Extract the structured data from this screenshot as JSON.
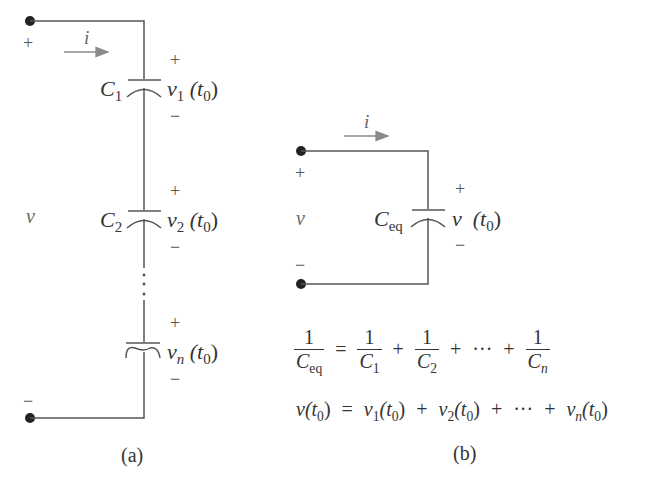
{
  "figure": {
    "series_circuit": {
      "caption": "(a)",
      "source_voltage": "v",
      "current": "i",
      "plus": "+",
      "minus": "−",
      "ellipsis": "⋮",
      "capacitors": [
        {
          "name": "C",
          "sub": "1",
          "voltage": "v",
          "vsub": "1",
          "time": "(t",
          "tsub": "0",
          "close": ")"
        },
        {
          "name": "C",
          "sub": "2",
          "voltage": "v",
          "vsub": "2",
          "time": "(t",
          "tsub": "0",
          "close": ")"
        },
        {
          "name": "C",
          "sub": "n",
          "voltage": "v",
          "vsub": "n",
          "time": "(t",
          "tsub": "0",
          "close": ")"
        }
      ]
    },
    "equivalent_circuit": {
      "caption": "(b)",
      "source_voltage": "v",
      "current": "i",
      "plus": "+",
      "minus": "−",
      "capacitor": {
        "name": "C",
        "sub": "eq",
        "voltage": "v",
        "time": "(t",
        "tsub": "0",
        "close": ")"
      }
    },
    "equations": {
      "eq1": {
        "lhs_num": "1",
        "lhs_den": "C",
        "lhs_den_sub": "eq",
        "equals": "=",
        "terms": [
          {
            "num": "1",
            "den": "C",
            "sub": "1"
          },
          {
            "num": "1",
            "den": "C",
            "sub": "2"
          },
          {
            "num": "1",
            "den": "C",
            "sub": "n"
          }
        ],
        "plus": "+",
        "dots": "···"
      },
      "eq2": {
        "lhs": "v(t",
        "lhs_sub": "0",
        "lhs_close": ")",
        "equals": "=",
        "terms": [
          {
            "v": "v",
            "vsub": "1",
            "t": "(t",
            "tsub": "0",
            "close": ")"
          },
          {
            "v": "v",
            "vsub": "2",
            "t": "(t",
            "tsub": "0",
            "close": ")"
          },
          {
            "v": "v",
            "vsub": "n",
            "t": "(t",
            "tsub": "0",
            "close": ")"
          }
        ],
        "plus": "+",
        "dots": "···"
      }
    },
    "colors": {
      "wire": "#555555",
      "text": "#333333",
      "arrow": "#888888",
      "background": "#ffffff"
    }
  }
}
